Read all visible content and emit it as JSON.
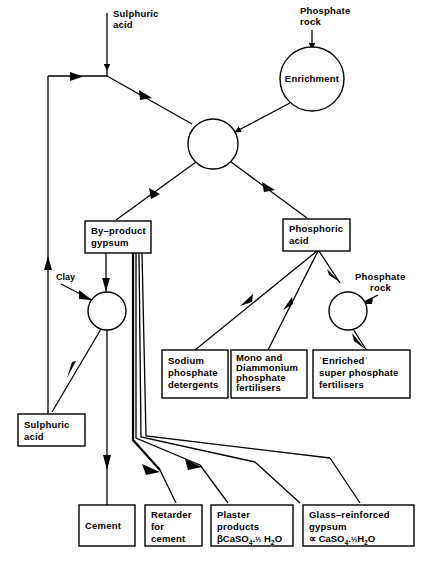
{
  "diagram": {
    "inputs": {
      "sulphuric_acid_top": "Sulphuric\nacid",
      "sulphuric_acid_top_line1": "Sulphuric",
      "sulphuric_acid_top_line2": "acid",
      "phosphate_rock_top_line1": "Phosphate",
      "phosphate_rock_top_line2": "rock",
      "phosphate_rock_mid_line1": "Phosphate",
      "phosphate_rock_mid_line2": "rock",
      "clay": "Clay"
    },
    "process_nodes": [
      {
        "id": "enrichment",
        "label": "Enrichment",
        "shape": "circle"
      },
      {
        "id": "reactor",
        "label": "",
        "shape": "circle"
      },
      {
        "id": "clay-mixer",
        "label": "",
        "shape": "circle"
      },
      {
        "id": "acidulation",
        "label": "",
        "shape": "circle"
      }
    ],
    "boxes": [
      {
        "id": "by-product-gypsum",
        "lines": [
          "By–product",
          "gypsum"
        ]
      },
      {
        "id": "phosphoric-acid",
        "lines": [
          "Phosphoric",
          "acid"
        ]
      },
      {
        "id": "sulphuric-acid-recycle",
        "lines": [
          "Sulphuric",
          "acid"
        ]
      },
      {
        "id": "sodium-phosphate-detergents",
        "lines": [
          "Sodium",
          "phosphate",
          "detergents"
        ]
      },
      {
        "id": "mono-diammonium-phosphate-fertilisers",
        "lines": [
          "Mono and",
          "Diammonium",
          "phosphate",
          "fertilisers"
        ]
      },
      {
        "id": "enriched-super-phosphate-fertilisers",
        "lines": [
          "ˈEnrichedˈ",
          "super phosphate",
          "fertilisers"
        ]
      },
      {
        "id": "cement",
        "lines": [
          "Cement"
        ]
      },
      {
        "id": "retarder-for-cement",
        "lines": [
          "Retarder",
          "for",
          "cement"
        ]
      },
      {
        "id": "plaster-products",
        "lines": [
          "Plaster",
          "products"
        ],
        "formula": {
          "prefix": "βCaSO",
          "sub1": "4",
          "dot": ".",
          "frac": "½",
          "space": " H",
          "sub2": "2",
          "suffix": "O"
        },
        "formula_text": "βCaSO4.½ H2O"
      },
      {
        "id": "glass-reinforced-gypsum",
        "lines": [
          "Glass–reinforced",
          "gypsum"
        ],
        "formula": {
          "prefix": "∝ CaSO",
          "sub1": "4",
          "dot": ".",
          "frac": "½",
          "space": "H",
          "sub2": "2",
          "suffix": "O"
        },
        "formula_text": "∝ CaSO4.½H2O"
      }
    ],
    "colors": {
      "stroke": "#000000",
      "fill": "#ffffff",
      "text": "#000000"
    }
  }
}
